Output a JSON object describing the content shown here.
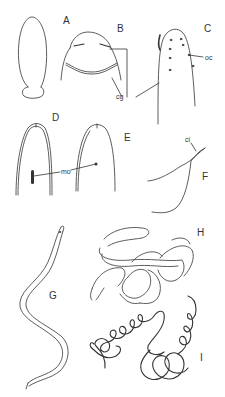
{
  "figure": {
    "panels": [
      {
        "id": "A",
        "label": "A",
        "description": "whole-body outline, elongated oval with narrowed base"
      },
      {
        "id": "B",
        "label": "B",
        "description": "anterior end showing cephalic glands"
      },
      {
        "id": "C",
        "label": "C",
        "description": "anterior end with ocelli"
      },
      {
        "id": "D",
        "label": "D",
        "description": "anterior end with elongate mouth"
      },
      {
        "id": "E",
        "label": "E",
        "description": "anterior end with round mouth"
      },
      {
        "id": "F",
        "label": "F",
        "description": "posterior tail with cirrus"
      },
      {
        "id": "G",
        "label": "G",
        "description": "extended body"
      },
      {
        "id": "H",
        "label": "H",
        "description": "coiled body, loose"
      },
      {
        "id": "I",
        "label": "I",
        "description": "coiled body, tight"
      }
    ],
    "annotations": {
      "cg": "cg",
      "oc": "oc",
      "mo": "mo",
      "ci": "ci"
    },
    "colors": {
      "line": "#333333",
      "background": "#ffffff"
    }
  }
}
